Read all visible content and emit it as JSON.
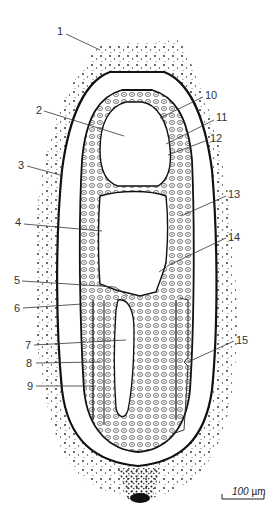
{
  "figure": {
    "type": "histological section drawing",
    "labels": [
      {
        "id": "1",
        "text": "1",
        "x": 57,
        "y": 26,
        "line": [
          66,
          34,
          100,
          50
        ]
      },
      {
        "id": "2",
        "text": "2",
        "x": 36,
        "y": 105,
        "line": [
          44,
          111,
          124,
          136
        ]
      },
      {
        "id": "3",
        "text": "3",
        "x": 18,
        "y": 160,
        "line": [
          27,
          166,
          60,
          175
        ]
      },
      {
        "id": "4",
        "text": "4",
        "x": 15,
        "y": 217,
        "line": [
          24,
          224,
          102,
          231
        ]
      },
      {
        "id": "5",
        "text": "5",
        "x": 14,
        "y": 275,
        "line": [
          22,
          281,
          115,
          287,
          128,
          296
        ]
      },
      {
        "id": "6",
        "text": "6",
        "x": 14,
        "y": 303,
        "line": [
          23,
          308,
          82,
          304
        ]
      },
      {
        "id": "7",
        "text": "7",
        "x": 25,
        "y": 340,
        "line": [
          34,
          345,
          126,
          340
        ]
      },
      {
        "id": "8",
        "text": "8",
        "x": 26,
        "y": 358,
        "line": [
          36,
          363,
          100,
          362
        ]
      },
      {
        "id": "9",
        "text": "9",
        "x": 27,
        "y": 381,
        "line": [
          36,
          386,
          96,
          386
        ]
      },
      {
        "id": "10",
        "text": "10",
        "x": 205,
        "y": 90,
        "line": [
          203,
          97,
          160,
          118
        ]
      },
      {
        "id": "11",
        "text": "11",
        "x": 216,
        "y": 112,
        "line": [
          214,
          120,
          166,
          144
        ]
      },
      {
        "id": "12",
        "text": "12",
        "x": 210,
        "y": 133,
        "line": [
          208,
          140,
          168,
          155
        ]
      },
      {
        "id": "13",
        "text": "13",
        "x": 228,
        "y": 189,
        "line": [
          226,
          196,
          181,
          216
        ]
      },
      {
        "id": "14",
        "text": "14",
        "x": 228,
        "y": 232,
        "line": [
          226,
          238,
          169,
          265,
          159,
          272
        ]
      },
      {
        "id": "15",
        "text": "15",
        "x": 236,
        "y": 335,
        "line": [
          234,
          341,
          188,
          362
        ]
      }
    ],
    "scale_bar": {
      "value": "100",
      "unit": "µm",
      "x1": 222,
      "x2": 264,
      "y": 499
    }
  },
  "colors": {
    "ink": "#1a1a1a",
    "paper": "#ffffff",
    "label": "#333333"
  }
}
